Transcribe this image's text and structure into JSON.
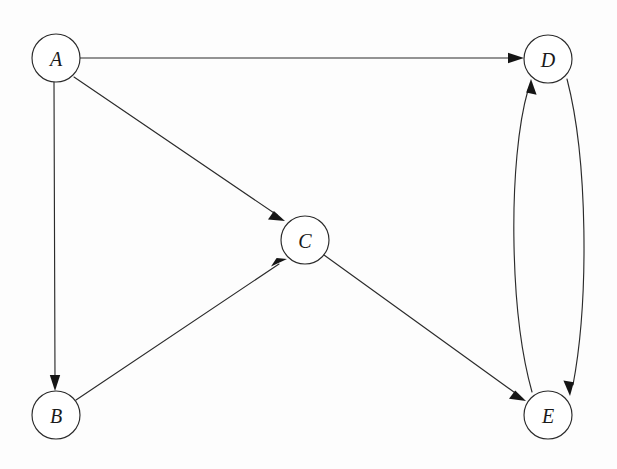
{
  "diagram": {
    "kind": "directed-graph",
    "background_color": "#fdfdfd",
    "stroke_color": "#2b2b2b",
    "arrow_color": "#151515",
    "node_fill_color": "#ffffff",
    "node_radius": 24,
    "nodes": [
      {
        "id": "A",
        "label": "A",
        "cx": 56,
        "cy": 58
      },
      {
        "id": "B",
        "label": "B",
        "cx": 56,
        "cy": 415
      },
      {
        "id": "C",
        "label": "C",
        "cx": 305,
        "cy": 240
      },
      {
        "id": "D",
        "label": "D",
        "cx": 548,
        "cy": 59
      },
      {
        "id": "E",
        "label": "E",
        "cx": 548,
        "cy": 415
      }
    ],
    "edges": [
      {
        "id": "A-D",
        "from": "A",
        "to": "D",
        "shape": "straight",
        "label": "",
        "directed": true
      },
      {
        "id": "A-B",
        "from": "A",
        "to": "B",
        "shape": "straight",
        "label": "",
        "directed": true
      },
      {
        "id": "A-C",
        "from": "A",
        "to": "C",
        "shape": "straight",
        "label": "",
        "directed": true
      },
      {
        "id": "B-C",
        "from": "B",
        "to": "C",
        "shape": "straight",
        "label": "",
        "directed": true
      },
      {
        "id": "C-E",
        "from": "C",
        "to": "E",
        "shape": "straight",
        "label": "",
        "directed": true
      },
      {
        "id": "D-E",
        "from": "D",
        "to": "E",
        "shape": "curved-right",
        "label": "",
        "directed": true
      },
      {
        "id": "E-D",
        "from": "E",
        "to": "D",
        "shape": "curved-left",
        "label": "",
        "directed": true
      }
    ],
    "node_count": 5,
    "edge_count": 7
  }
}
